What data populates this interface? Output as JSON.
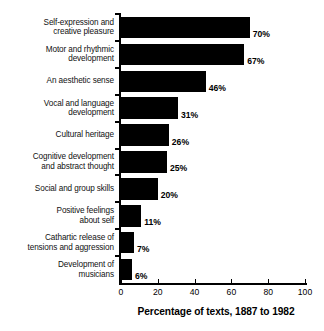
{
  "chart_data": {
    "type": "bar",
    "orientation": "horizontal",
    "title": "",
    "xlabel": "Percentage of texts, 1887 to 1982",
    "ylabel": "",
    "xlim": [
      0,
      100
    ],
    "xticks": [
      0,
      20,
      40,
      60,
      80,
      100
    ],
    "xtick_labels": [
      "0",
      "20",
      "40",
      "60",
      "80",
      "100"
    ],
    "grid": false,
    "legend": false,
    "bar_color": "#000000",
    "categories": [
      "Self-expression and creative pleasure",
      "Motor and rhythmic development",
      "An aesthetic sense",
      "Vocal and language development",
      "Cultural heritage",
      "Cognitive development and abstract thought",
      "Social and group skills",
      "Positive feelings about self",
      "Cathartic release of tensions and aggression",
      "Development of musicians"
    ],
    "category_lines": [
      [
        "Self-expression and",
        "creative pleasure"
      ],
      [
        "Motor and rhythmic",
        "development"
      ],
      [
        "An aesthetic sense"
      ],
      [
        "Vocal and language",
        "development"
      ],
      [
        "Cultural heritage"
      ],
      [
        "Cognitive development",
        "and abstract thought"
      ],
      [
        "Social and group skills"
      ],
      [
        "Positive feelings",
        "about self"
      ],
      [
        "Cathartic release of",
        "tensions and aggression"
      ],
      [
        "Development of",
        "musicians"
      ]
    ],
    "values": [
      70,
      67,
      46,
      31,
      26,
      25,
      20,
      11,
      7,
      6
    ],
    "value_labels": [
      "70%",
      "67%",
      "46%",
      "31%",
      "26%",
      "25%",
      "20%",
      "11%",
      "7%",
      "6%"
    ]
  }
}
